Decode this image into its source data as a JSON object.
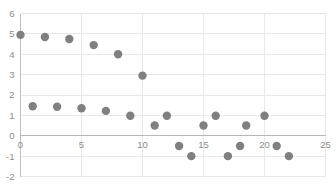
{
  "chart_data": {
    "type": "scatter",
    "title": "",
    "xlabel": "",
    "ylabel": "",
    "xlim": [
      0,
      25
    ],
    "ylim": [
      -2,
      6
    ],
    "xticks": [
      0,
      5,
      10,
      15,
      20,
      25
    ],
    "yticks": [
      -2,
      -1,
      0,
      1,
      2,
      3,
      4,
      5,
      6
    ],
    "xtick_labels": [
      "0",
      "5",
      "10",
      "15",
      "20",
      "25"
    ],
    "ytick_labels": [
      "-2",
      "-1",
      "0",
      "1",
      "2",
      "3",
      "4",
      "5",
      "6"
    ],
    "grid": true,
    "legend": "none",
    "marker_color": "#808080",
    "marker_size": 4.2,
    "series": [
      {
        "name": "series-1",
        "points": [
          {
            "x": 0,
            "y": 4.95
          },
          {
            "x": 1,
            "y": 1.45
          },
          {
            "x": 2,
            "y": 4.85
          },
          {
            "x": 3,
            "y": 1.42
          },
          {
            "x": 4,
            "y": 4.75
          },
          {
            "x": 5,
            "y": 1.35
          },
          {
            "x": 6,
            "y": 4.45
          },
          {
            "x": 7,
            "y": 1.22
          },
          {
            "x": 8,
            "y": 4.0
          },
          {
            "x": 9,
            "y": 0.98
          },
          {
            "x": 10,
            "y": 2.95
          },
          {
            "x": 11,
            "y": 0.5
          },
          {
            "x": 12,
            "y": 0.98
          },
          {
            "x": 13,
            "y": -0.5
          },
          {
            "x": 14,
            "y": -1.0
          },
          {
            "x": 15,
            "y": 0.5
          },
          {
            "x": 16,
            "y": 0.98
          },
          {
            "x": 17,
            "y": -1.0
          },
          {
            "x": 18,
            "y": -0.5
          },
          {
            "x": 18.5,
            "y": 0.5
          },
          {
            "x": 20,
            "y": 0.98
          },
          {
            "x": 21,
            "y": -0.5
          },
          {
            "x": 22,
            "y": -1.0
          }
        ]
      }
    ]
  }
}
